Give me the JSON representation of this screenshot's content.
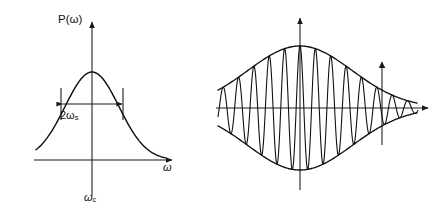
{
  "figure": {
    "background_color": "#ffffff",
    "ink_color": "#111111",
    "width": 440,
    "height": 215
  },
  "panels": {
    "left": {
      "name": "power-spectrum",
      "yaxis_label": "P(ω)",
      "xaxis_label": "ω",
      "center_label_symbol": "ω",
      "center_label_subscript": "c",
      "width_label_prefix": "2ω",
      "width_label_subscript": "s",
      "geometry": {
        "origin_x": 92,
        "baseline_y": 160,
        "yaxis_top": 22,
        "xaxis_left": 34,
        "xaxis_right": 172,
        "peak_y": 72,
        "sigma_px": 27,
        "half_width_px": 31,
        "width_arrow_y": 104,
        "tick_top_y": 88,
        "tick_bottom_y": 120
      }
    },
    "right": {
      "name": "autocorrelation",
      "yaxis_label": "E(τ)*E(0)",
      "tau_label_lhs": "τ =",
      "tau_numerator": "1",
      "tau_denominator_symbol": "ω",
      "tau_denominator_subscript": "s",
      "geometry": {
        "origin_x": 90,
        "baseline_y": 108,
        "yaxis_top": 18,
        "xaxis_left": 6,
        "xaxis_right": 218,
        "envelope_amplitude": 62,
        "sigma_px": 52,
        "carrier_cycles": 13,
        "marker_x": 172,
        "marker_bottom_y": 145,
        "marker_top_y": 62
      }
    }
  },
  "chart_data": {
    "type": "line",
    "title": "",
    "panel_count": 2,
    "charts": [
      {
        "name": "power-spectrum",
        "type": "line",
        "title": "P(ω)",
        "xlabel": "ω",
        "ylabel": "P(ω)",
        "curve": "gaussian",
        "description": "Gaussian power spectrum centered at omega_c with full width 2*omega_s",
        "center": "ωc",
        "full_width": "2ωs",
        "annotations": [
          {
            "text": "2ωs",
            "kind": "double-headed-width-arrow",
            "at": "half-maximum"
          },
          {
            "text": "ωc",
            "kind": "axis-center-tick",
            "at": "origin"
          }
        ],
        "x": [
          -3.0,
          -2.6,
          -2.2,
          -1.8,
          -1.4,
          -1.0,
          -0.6,
          -0.2,
          0.2,
          0.6,
          1.0,
          1.4,
          1.8,
          2.2,
          2.6,
          3.0
        ],
        "y": [
          0.011,
          0.034,
          0.087,
          0.198,
          0.375,
          0.607,
          0.835,
          0.98,
          0.98,
          0.835,
          0.607,
          0.375,
          0.198,
          0.087,
          0.034,
          0.011
        ],
        "xlim": [
          -3.2,
          3.2
        ],
        "ylim": [
          0,
          1.1
        ],
        "grid": false,
        "legend": false
      },
      {
        "name": "autocorrelation",
        "type": "line",
        "title": "E(τ)*E(0)",
        "xlabel": "τ",
        "ylabel": "E(τ)*E(0)",
        "curve": "gaussian-enveloped-cosine",
        "description": "Fourier transform of the Gaussian spectrum: cosine carrier under a Gaussian envelope; coherence time tau = 1/omega_s",
        "envelope": "gaussian",
        "carrier_cycles": 13,
        "annotations": [
          {
            "text": "τ = 1/ωs",
            "kind": "vertical-arrow-marker",
            "at": "envelope-tail-right"
          }
        ],
        "x": [
          -2.0,
          -1.6,
          -1.2,
          -0.8,
          -0.4,
          0.0,
          0.4,
          0.8,
          1.2,
          1.6,
          2.0
        ],
        "envelope_y": [
          0.018,
          0.077,
          0.237,
          0.527,
          0.852,
          1.0,
          0.852,
          0.527,
          0.237,
          0.077,
          0.018
        ],
        "xlim": [
          -2.2,
          2.2
        ],
        "ylim": [
          -1.1,
          1.1
        ],
        "grid": false,
        "legend": false
      }
    ]
  }
}
